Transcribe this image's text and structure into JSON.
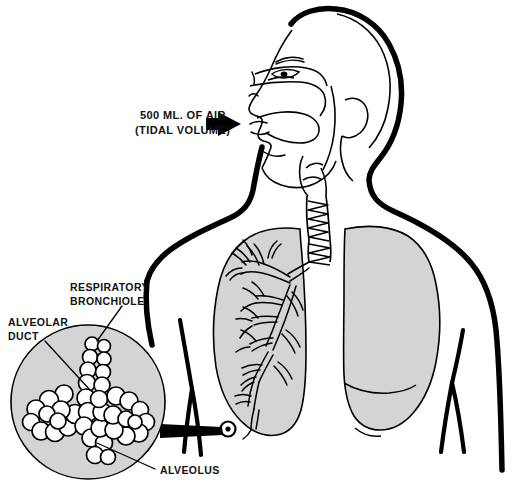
{
  "diagram": {
    "view": "lateral-profile-upper-body",
    "background_color": "#ffffff",
    "ink_color": "#000000",
    "organ_fill_color": "#d4d4d4",
    "alveoli_fill_color": "#ffffff"
  },
  "annotations": {
    "tidal_volume": {
      "line1": "500 ML. OF AIR",
      "line2": "(TIDAL VOLUME)",
      "arrow": "arrow-right-solid",
      "points_to": "mouth-and-nose-airway-entry"
    },
    "respiratory_bronchiole": {
      "label": "RESPIRATORY BRONCHIOLE",
      "line1": "RESPIRATORY",
      "line2": "BRONCHIOLE",
      "points_to": "bronchiole-stem-in-inset"
    },
    "alveolar_duct": {
      "label": "ALVEOLAR DUCT",
      "line1": "ALVEOLAR",
      "line2": "DUCT",
      "points_to": "duct-center-in-inset"
    },
    "alveolus": {
      "label": "ALVEOLUS",
      "line1": "ALVEOLUS",
      "points_to": "single-alveolar-sac-in-inset"
    }
  },
  "anatomy_parts": [
    {
      "name": "head-profile",
      "fill": "#ffffff",
      "stroke": "#000000"
    },
    {
      "name": "nasal-cavity",
      "fill": "#ffffff",
      "stroke": "#000000"
    },
    {
      "name": "oral-cavity-tongue",
      "fill": "#ffffff",
      "stroke": "#000000"
    },
    {
      "name": "pharynx",
      "fill": "#ffffff",
      "stroke": "#000000"
    },
    {
      "name": "larynx",
      "fill": "#ffffff",
      "stroke": "#000000"
    },
    {
      "name": "trachea",
      "fill": "#ffffff",
      "stroke": "#000000"
    },
    {
      "name": "left-lung-bronchial-tree",
      "fill": "#d4d4d4",
      "stroke": "#000000"
    },
    {
      "name": "right-lung-solid",
      "fill": "#d4d4d4",
      "stroke": "#000000"
    },
    {
      "name": "torso-outline",
      "fill": "none",
      "stroke": "#000000"
    },
    {
      "name": "magnifier-inset-circle",
      "fill": "#d4d4d4",
      "stroke": "#000000"
    },
    {
      "name": "alveolar-cluster",
      "fill": "#ffffff",
      "stroke": "#000000"
    }
  ]
}
